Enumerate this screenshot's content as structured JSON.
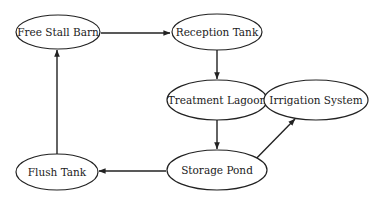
{
  "diagram": {
    "type": "flowchart",
    "nodes": [
      {
        "id": "free_stall_barn",
        "label": "Free Stall Barn",
        "cx": 58,
        "cy": 32,
        "rx": 42,
        "ry": 17
      },
      {
        "id": "reception_tank",
        "label": "Reception Tank",
        "cx": 217,
        "cy": 32,
        "rx": 45,
        "ry": 18
      },
      {
        "id": "treatment_lagoon",
        "label": "Treatment Lagoon",
        "cx": 217,
        "cy": 100,
        "rx": 50,
        "ry": 20
      },
      {
        "id": "irrigation_system",
        "label": "Irrigation System",
        "cx": 316,
        "cy": 100,
        "rx": 52,
        "ry": 20
      },
      {
        "id": "storage_pond",
        "label": "Storage Pond",
        "cx": 217,
        "cy": 170,
        "rx": 50,
        "ry": 20
      },
      {
        "id": "flush_tank",
        "label": "Flush Tank",
        "cx": 57,
        "cy": 172,
        "rx": 41,
        "ry": 18
      }
    ],
    "edges": [
      {
        "from": "free_stall_barn",
        "to": "reception_tank",
        "x1": 101,
        "y1": 33,
        "x2": 170,
        "y2": 33
      },
      {
        "from": "reception_tank",
        "to": "treatment_lagoon",
        "x1": 217,
        "y1": 50,
        "x2": 217,
        "y2": 79
      },
      {
        "from": "treatment_lagoon",
        "to": "storage_pond",
        "x1": 217,
        "y1": 120,
        "x2": 217,
        "y2": 149
      },
      {
        "from": "storage_pond",
        "to": "flush_tank",
        "x1": 166,
        "y1": 171,
        "x2": 99,
        "y2": 171
      },
      {
        "from": "flush_tank",
        "to": "free_stall_barn",
        "x1": 57,
        "y1": 154,
        "x2": 57,
        "y2": 50
      },
      {
        "from": "storage_pond",
        "to": "irrigation_system",
        "x1": 246,
        "y1": 169,
        "x2": 295,
        "y2": 119
      }
    ]
  }
}
